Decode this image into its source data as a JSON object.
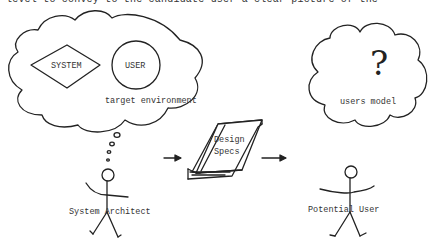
{
  "caption_fragment": "level to convey to the candidate user a clear picture of the",
  "left_cloud": {
    "system_label": "SYSTEM",
    "user_label": "USER",
    "caption": "target environment"
  },
  "right_cloud": {
    "symbol": "?",
    "caption": "users model"
  },
  "book": {
    "line1": "Design",
    "line2": "Specs"
  },
  "actors": {
    "left": "System Architect",
    "right": "Potential User"
  },
  "arrows": [
    "architect-to-specs",
    "specs-to-user"
  ]
}
